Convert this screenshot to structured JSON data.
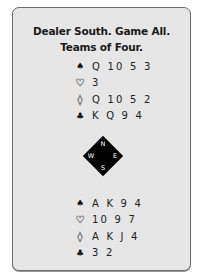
{
  "header": {
    "line1": "Dealer South. Game All.",
    "line2": "Teams of Four."
  },
  "north": {
    "suits": [
      {
        "suit": "spades",
        "symbol": "♠",
        "cards": "Q 10 5 3"
      },
      {
        "suit": "hearts",
        "symbol": "♡",
        "cards": "3"
      },
      {
        "suit": "diamonds",
        "symbol": "◊",
        "cards": "Q 10 5 2"
      },
      {
        "suit": "clubs",
        "symbol": "♣",
        "cards": "K Q 9 4"
      }
    ]
  },
  "compass": {
    "n": "N",
    "s": "S",
    "w": "W",
    "e": "E"
  },
  "south": {
    "suits": [
      {
        "suit": "spades",
        "symbol": "♠",
        "cards": "A K 9 4"
      },
      {
        "suit": "hearts",
        "symbol": "♡",
        "cards": "10 9 7"
      },
      {
        "suit": "diamonds",
        "symbol": "◊",
        "cards": "A K J 4"
      },
      {
        "suit": "clubs",
        "symbol": "♣",
        "cards": "3 2"
      }
    ]
  },
  "colors": {
    "card_bg": "#e6e6e6",
    "card_border": "#6e6e6e",
    "compass": "#000000"
  }
}
